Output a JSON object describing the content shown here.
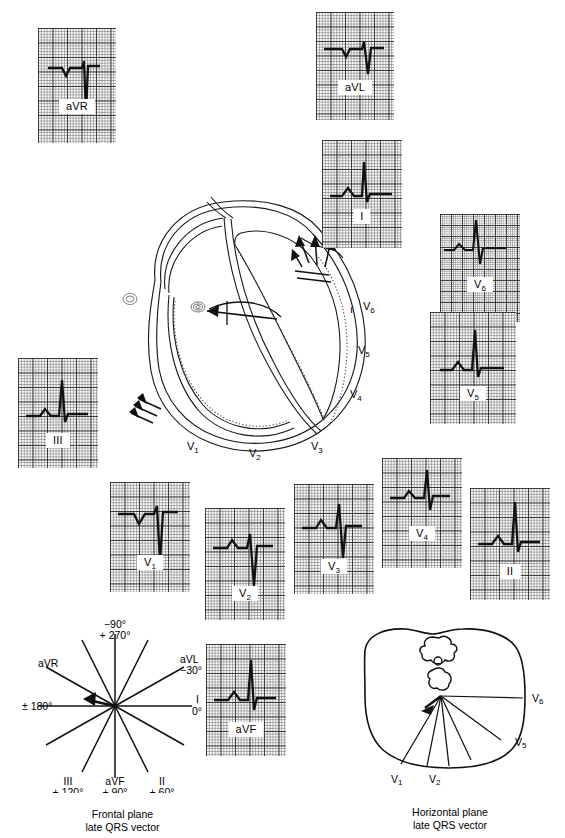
{
  "figure": {
    "type": "ecg-12-lead-vector-diagram",
    "background": "#ffffff",
    "trace_color": "#111111"
  },
  "ecg_strips": [
    {
      "id": "aVR",
      "label": "aVR",
      "x": 38,
      "y": 28,
      "w": 78,
      "h": 115,
      "morphology": "small-r-deep-S",
      "grid": "coarse"
    },
    {
      "id": "aVL",
      "label": "aVL",
      "x": 316,
      "y": 12,
      "w": 78,
      "h": 108,
      "morphology": "qrs-biphasic-small",
      "grid": "coarse"
    },
    {
      "id": "I",
      "label": "I",
      "x": 322,
      "y": 140,
      "w": 80,
      "h": 108,
      "morphology": "tall-R",
      "grid": "coarse"
    },
    {
      "id": "V6",
      "label": "V6",
      "x": 440,
      "y": 214,
      "w": 80,
      "h": 108,
      "morphology": "rS-sharp",
      "grid": "fine"
    },
    {
      "id": "V5",
      "label": "V5",
      "x": 430,
      "y": 312,
      "w": 86,
      "h": 112,
      "morphology": "tall-R",
      "grid": "coarse"
    },
    {
      "id": "III",
      "label": "III",
      "x": 18,
      "y": 358,
      "w": 80,
      "h": 110,
      "morphology": "tall-R",
      "grid": "coarse"
    },
    {
      "id": "V1",
      "label": "V1",
      "x": 110,
      "y": 482,
      "w": 80,
      "h": 110,
      "morphology": "rS-deep-S",
      "grid": "coarse"
    },
    {
      "id": "V2",
      "label": "V2",
      "x": 205,
      "y": 508,
      "w": 80,
      "h": 112,
      "morphology": "rS-deep-S",
      "grid": "coarse"
    },
    {
      "id": "V3",
      "label": "V3",
      "x": 294,
      "y": 484,
      "w": 80,
      "h": 110,
      "morphology": "RS-transition",
      "grid": "coarse"
    },
    {
      "id": "V4",
      "label": "V4",
      "x": 382,
      "y": 458,
      "w": 80,
      "h": 110,
      "morphology": "tall-R-small-s",
      "grid": "coarse"
    },
    {
      "id": "II",
      "label": "II",
      "x": 470,
      "y": 488,
      "w": 80,
      "h": 112,
      "morphology": "tall-R",
      "grid": "coarse"
    },
    {
      "id": "aVF",
      "label": "aVF",
      "x": 206,
      "y": 644,
      "w": 80,
      "h": 112,
      "morphology": "tall-R",
      "grid": "coarse"
    }
  ],
  "heart_diagram": {
    "name": "heart-cross-section",
    "chamber_labels": [],
    "precordial_labels": [
      {
        "text": "V6",
        "x": 268,
        "y": 124
      },
      {
        "text": "V5",
        "x": 263,
        "y": 168
      },
      {
        "text": "V4",
        "x": 255,
        "y": 212
      },
      {
        "text": "V3",
        "x": 215,
        "y": 263
      },
      {
        "text": "V2",
        "x": 155,
        "y": 270
      },
      {
        "text": "V1",
        "x": 94,
        "y": 263
      }
    ],
    "arrows_note": "late QRS activation arrows at lateral LV wall and septum"
  },
  "frontal_plane": {
    "name": "frontal-plane-hexaxial",
    "x": 20,
    "y": 618,
    "w": 205,
    "h": 205,
    "caption_line1": "Frontal plane",
    "caption_line2": "late QRS vector",
    "axes": [
      {
        "label": "aVR",
        "angle_deg": -150,
        "side": "upper-left"
      },
      {
        "label": "aVL",
        "angle_deg": -30,
        "side": "upper-right"
      },
      {
        "label": "I",
        "angle_deg": 0,
        "side": "right"
      },
      {
        "label": "II",
        "angle_deg": 60,
        "side": "lower-right"
      },
      {
        "label": "aVF",
        "angle_deg": 90,
        "side": "bottom"
      },
      {
        "label": "III",
        "angle_deg": 120,
        "side": "lower-left"
      }
    ],
    "tick_labels": {
      "top": "−90°",
      "top_alt": "+ 270°",
      "avl_deg": "−30°",
      "i_deg": "0°",
      "left_deg": "± 180°",
      "iii_deg": "+ 120°",
      "avf_deg": "+ 90°",
      "ii_deg": "+ 60°"
    },
    "vector": {
      "direction_deg": 168,
      "length": 32,
      "description": "short leftward late QRS vector"
    }
  },
  "horizontal_plane": {
    "name": "horizontal-plane-thorax",
    "x": 345,
    "y": 620,
    "w": 210,
    "h": 200,
    "caption_line1": "Horizontal plane",
    "caption_line2": "late QRS vector",
    "lead_labels": [
      {
        "text": "V1",
        "x": 55,
        "y": 160
      },
      {
        "text": "V2",
        "x": 93,
        "y": 160
      },
      {
        "text": "V5",
        "x": 176,
        "y": 126
      },
      {
        "text": "V6",
        "x": 184,
        "y": 85
      }
    ],
    "vector": {
      "description": "short posterior-leftward late QRS vector at heart origin"
    }
  }
}
